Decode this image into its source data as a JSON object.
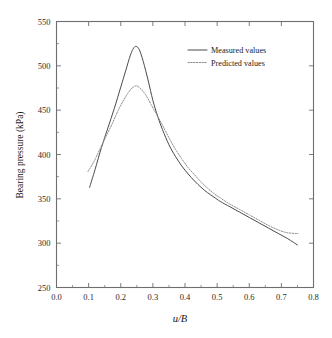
{
  "chart_data": {
    "type": "line",
    "title": "",
    "xlabel": "u/B",
    "ylabel": "Bearing pressure (kPa)",
    "xlim": [
      0.0,
      0.8
    ],
    "ylim": [
      250,
      550
    ],
    "grid": false,
    "legend_position": "top-right",
    "xticks": [
      "0.0",
      "0.1",
      "0.2",
      "0.3",
      "0.4",
      "0.5",
      "0.6",
      "0.7",
      "0.8"
    ],
    "xtick_values": [
      0.0,
      0.1,
      0.2,
      0.3,
      0.4,
      0.5,
      0.6,
      0.7,
      0.8
    ],
    "xtick_minor_values": [
      0.05,
      0.15,
      0.25,
      0.35,
      0.45,
      0.55,
      0.65,
      0.75
    ],
    "yticks": [
      "250",
      "300",
      "350",
      "400",
      "450",
      "500",
      "550"
    ],
    "ytick_values": [
      250,
      300,
      350,
      400,
      450,
      500,
      550
    ],
    "ytick_minor_values": [
      275,
      325,
      375,
      425,
      475,
      525
    ],
    "series": [
      {
        "name": "Measured values",
        "style": "solid",
        "color": "#4a4a4a",
        "x": [
          0.103,
          0.12,
          0.14,
          0.16,
          0.18,
          0.2,
          0.215,
          0.23,
          0.24,
          0.248,
          0.258,
          0.27,
          0.285,
          0.3,
          0.315,
          0.33,
          0.35,
          0.37,
          0.39,
          0.41,
          0.43,
          0.45,
          0.47,
          0.49,
          0.51,
          0.54,
          0.57,
          0.6,
          0.63,
          0.66,
          0.69,
          0.72,
          0.75
        ],
        "y": [
          363,
          383,
          408,
          430,
          452,
          476,
          494,
          512,
          520,
          522,
          518,
          505,
          484,
          461,
          443,
          428,
          411,
          398,
          387,
          378,
          370,
          363,
          357,
          352,
          347,
          341,
          335,
          329,
          323,
          317,
          311,
          305,
          298
        ]
      },
      {
        "name": "Predicted values",
        "style": "dotted",
        "color": "#8d8d8d",
        "x": [
          0.098,
          0.115,
          0.135,
          0.155,
          0.175,
          0.195,
          0.215,
          0.23,
          0.243,
          0.252,
          0.265,
          0.28,
          0.295,
          0.312,
          0.33,
          0.35,
          0.37,
          0.39,
          0.41,
          0.43,
          0.45,
          0.47,
          0.49,
          0.51,
          0.54,
          0.57,
          0.6,
          0.63,
          0.66,
          0.69,
          0.715,
          0.74,
          0.752
        ],
        "y": [
          381,
          391,
          406,
          421,
          436,
          452,
          465,
          473,
          477,
          477,
          473,
          466,
          456,
          445,
          433,
          419,
          406,
          395,
          385,
          377,
          369,
          362,
          356,
          351,
          344,
          338,
          332,
          326,
          320,
          315,
          312,
          311,
          311
        ]
      }
    ],
    "legend": [
      {
        "label": "Measured values",
        "style": "solid"
      },
      {
        "label": "Predicted values",
        "style": "dotted"
      }
    ]
  },
  "colors": {
    "axis": "#6e6e6e",
    "measured": "#4a4a4a",
    "predicted": "#8d8d8d",
    "background": "#ffffff",
    "text": "#1a1a1a"
  }
}
